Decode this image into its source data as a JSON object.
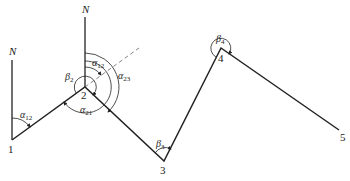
{
  "diagram": {
    "type": "traverse-azimuth-diagram",
    "north_label": "N",
    "points": [
      {
        "id": "1",
        "label": "1",
        "x": 12,
        "y": 140
      },
      {
        "id": "2",
        "label": "2",
        "x": 85,
        "y": 87
      },
      {
        "id": "3",
        "label": "3",
        "x": 164,
        "y": 161
      },
      {
        "id": "4",
        "label": "4",
        "x": 221,
        "y": 48
      },
      {
        "id": "5",
        "label": "5",
        "x": 339,
        "y": 130
      }
    ],
    "angles": {
      "alpha12_at1": {
        "sym": "α",
        "sub": "12"
      },
      "alpha12_at2": {
        "sym": "α",
        "sub": "12"
      },
      "alpha23": {
        "sym": "α",
        "sub": "23"
      },
      "alpha21": {
        "sym": "α",
        "sub": "21"
      },
      "beta2": {
        "sym": "β",
        "sub": "2"
      },
      "beta3": {
        "sym": "β",
        "sub": "3"
      },
      "beta4": {
        "sym": "β",
        "sub": "4"
      }
    },
    "colors": {
      "line": "#222222",
      "dashed": "#666666"
    }
  }
}
